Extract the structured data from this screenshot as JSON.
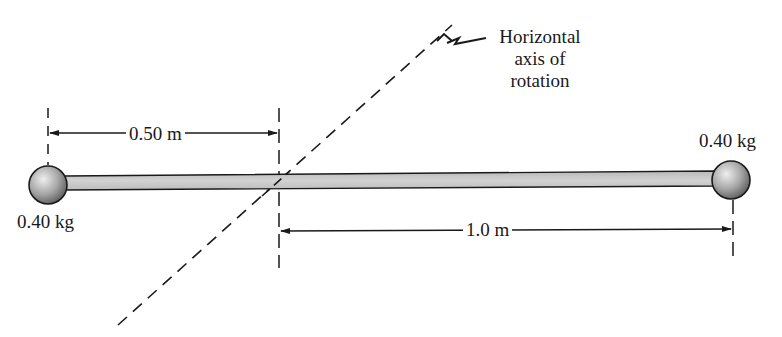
{
  "diagram": {
    "type": "rotating-rod-with-masses",
    "axis_label": {
      "line1": "Horizontal",
      "line2": "axis of",
      "line3": "rotation"
    },
    "left_mass": {
      "label": "0.40 kg"
    },
    "right_mass": {
      "label": "0.40 kg"
    },
    "dimension_left": {
      "label": "0.50 m"
    },
    "dimension_right": {
      "label": "1.0 m"
    },
    "colors": {
      "line": "#1a1a1a",
      "rod_fill": "#c8c8c8",
      "ball_light": "#e8e8e8",
      "ball_dark": "#6e6e6e",
      "background": "#ffffff"
    }
  }
}
